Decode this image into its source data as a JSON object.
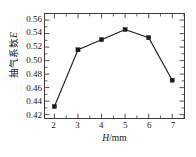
{
  "chart_data": {
    "type": "line",
    "title": "",
    "xlabel_prefix": "H",
    "xlabel_suffix": "/mm",
    "ylabel_prefix": "抽气系数",
    "ylabel_suffix": "E",
    "x": [
      2,
      3,
      4,
      5,
      6,
      7
    ],
    "values": [
      0.432,
      0.516,
      0.531,
      0.546,
      0.534,
      0.471
    ],
    "series": [
      {
        "name": "抽气系数E",
        "values": [
          0.432,
          0.516,
          0.531,
          0.546,
          0.534,
          0.471
        ]
      }
    ],
    "xlim": [
      1.6,
      7.5
    ],
    "ylim": [
      0.415,
      0.569
    ],
    "xticks": [
      2,
      3,
      4,
      5,
      6,
      7
    ],
    "xtick_labels": [
      "2",
      "3",
      "4",
      "5",
      "6",
      "7"
    ],
    "yticks": [
      0.42,
      0.44,
      0.46,
      0.48,
      0.5,
      0.52,
      0.54,
      0.56
    ],
    "ytick_labels": [
      "0.42",
      "0.44",
      "0.46",
      "0.48",
      "0.50",
      "0.52",
      "0.54",
      "0.56"
    ],
    "x_minor_interval": 0.5,
    "y_minor_interval": 0.01,
    "grid": false,
    "legend": false,
    "marker": "square",
    "marker_color": "#1a1a1a",
    "line_color": "#1a1a1a",
    "frame_color": "#3a3a3a",
    "background": "#ffffff"
  }
}
